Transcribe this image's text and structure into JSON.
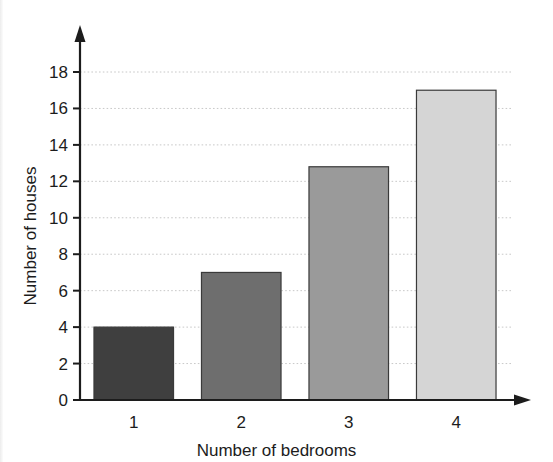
{
  "chart_data": {
    "type": "bar",
    "title": "",
    "xlabel": "Number of bedrooms",
    "ylabel": "Number of houses",
    "categories": [
      "1",
      "2",
      "3",
      "4"
    ],
    "values": [
      4,
      7,
      12.8,
      17
    ],
    "ylim": [
      0,
      18
    ],
    "ytick_labels": [
      "0",
      "2",
      "4",
      "6",
      "8",
      "10",
      "12",
      "14",
      "16",
      "18"
    ],
    "ytick_values": [
      0,
      2,
      4,
      6,
      8,
      10,
      12,
      14,
      16,
      18
    ],
    "grid": "horizontal-dotted",
    "legend": "none",
    "bar_colors": [
      "#3f3f3f",
      "#6e6e6e",
      "#9a9a9a",
      "#d5d5d5"
    ],
    "bar_edge_color": "#3a3a3a",
    "axis_color": "#1c1c1c",
    "grid_color": "#c8c8c8",
    "background": "#ffffff",
    "axis_arrows": true
  }
}
